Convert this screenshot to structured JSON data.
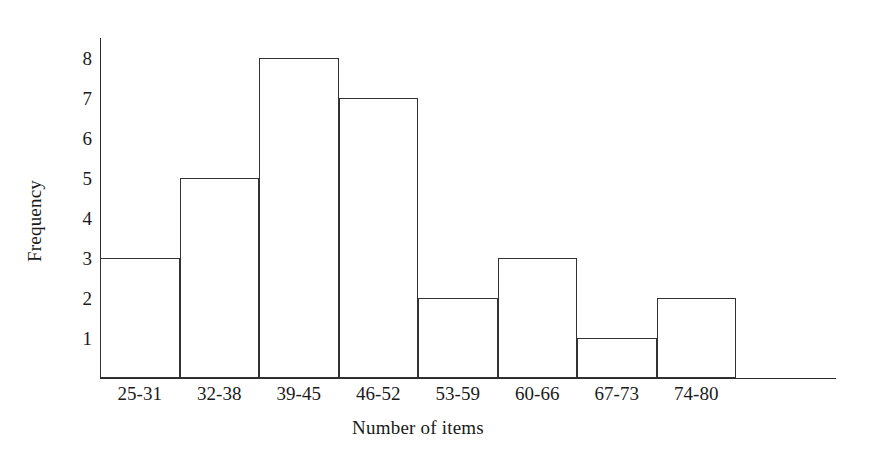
{
  "chart_data": {
    "type": "bar",
    "title": "",
    "xlabel": "Number of items",
    "ylabel": "Frequency",
    "categories": [
      "25-31",
      "32-38",
      "39-45",
      "46-52",
      "53-59",
      "60-66",
      "67-73",
      "74-80"
    ],
    "values": [
      3,
      5,
      8,
      7,
      2,
      3,
      1,
      2
    ],
    "ylim": [
      0,
      8.5
    ],
    "yticks": [
      8,
      7,
      6,
      5,
      4,
      3,
      2,
      1
    ],
    "grid": false,
    "legend": null,
    "bar_style": {
      "fill": "none",
      "edge_color": "#333333",
      "gap": 0
    },
    "axis_color": "#2b2b2b",
    "background": "#ffffff"
  }
}
